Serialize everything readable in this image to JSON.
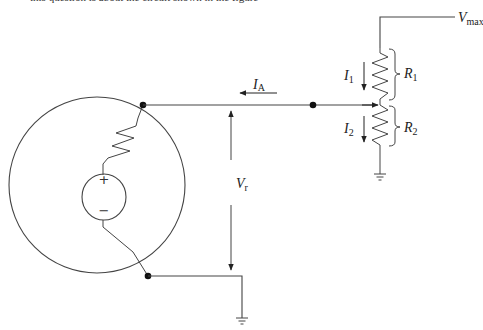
{
  "header": {
    "cutoff_text": "this question is about the circuit shown in the figure"
  },
  "diagram": {
    "type": "circuit",
    "colors": {
      "line": "#444444",
      "node": "#111111",
      "background": "#ffffff"
    },
    "labels": {
      "v_max": {
        "main": "V",
        "sub": "max"
      },
      "i_a": {
        "main": "I",
        "sub": "A"
      },
      "i_1": {
        "main": "I",
        "sub": "1"
      },
      "i_2": {
        "main": "I",
        "sub": "2"
      },
      "r_1": {
        "main": "R",
        "sub": "1"
      },
      "r_2": {
        "main": "R",
        "sub": "2"
      },
      "v_r": {
        "main": "V",
        "sub": "r"
      },
      "plus": "+",
      "minus": "−"
    },
    "components": [
      "sensor enclosure (circle) containing voltage source in series with internal resistor",
      "potentiometer R1/R2 between Vmax and ground with wiper",
      "current IA flowing from wiper toward sensor",
      "voltage Vr measured across sensor terminals",
      "ground symbols at potentiometer bottom and sensor return"
    ]
  }
}
